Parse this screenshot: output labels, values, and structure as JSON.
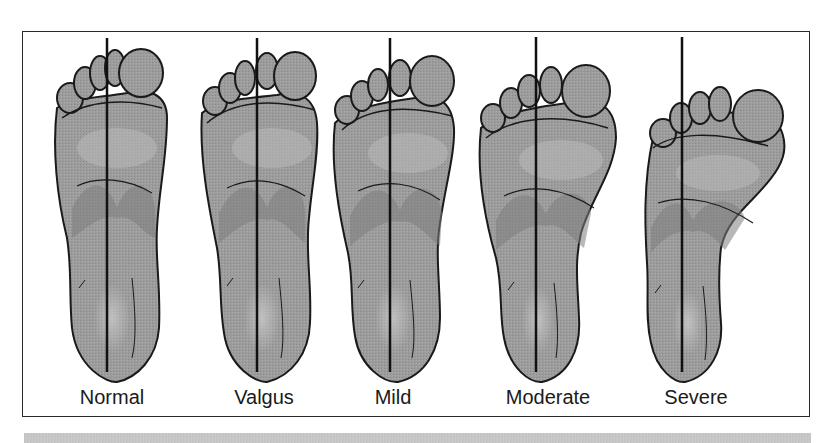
{
  "figure": {
    "type": "medical-illustration",
    "panels": [
      {
        "label": "Normal",
        "center_x": 107,
        "line_x": 107,
        "deformity": 0
      },
      {
        "label": "Valgus",
        "center_x": 257,
        "line_x": 257,
        "deformity": 1
      },
      {
        "label": "Mild",
        "center_x": 390,
        "line_x": 390,
        "deformity": 2
      },
      {
        "label": "Moderate",
        "center_x": 536,
        "line_x": 536,
        "deformity": 3
      },
      {
        "label": "Severe",
        "center_x": 683,
        "line_x": 682,
        "deformity": 4
      }
    ]
  },
  "colors": {
    "foot_fill": "#9a9a9a",
    "foot_light": "#b4b4b4",
    "foot_dark": "#7e7e7e",
    "outline": "#1a1a1a",
    "frame": "#2a2a2a",
    "bar": "#c6c6c6"
  }
}
